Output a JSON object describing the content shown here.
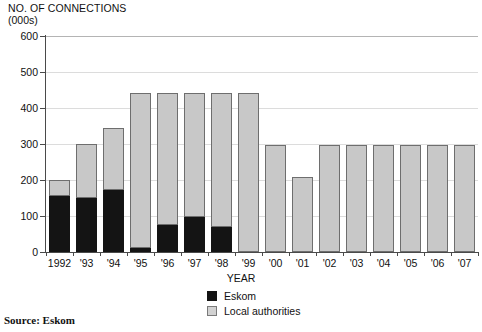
{
  "chart_data": {
    "type": "bar",
    "subtype": "stacked",
    "title": "NO. OF CONNECTIONS",
    "subtitle": "(000s)",
    "xlabel": "YEAR",
    "ylabel": "NO. OF CONNECTIONS (000s)",
    "ylim": [
      0,
      600
    ],
    "yticks": [
      0,
      100,
      200,
      300,
      400,
      500,
      600
    ],
    "ytick_labels": [
      "0",
      "100",
      "200",
      "300",
      "400",
      "500",
      "600"
    ],
    "grid": true,
    "legend_position": "bottom-center",
    "categories": [
      "1992",
      "'93",
      "'94",
      "'95",
      "'96",
      "'97",
      "'98",
      "'99",
      "'00",
      "'01",
      "'02",
      "'03",
      "'04",
      "'05",
      "'06",
      "'07"
    ],
    "series": [
      {
        "name": "Eskom",
        "color": "#141414",
        "values": [
          155,
          150,
          172,
          10,
          75,
          98,
          70,
          0,
          0,
          0,
          0,
          0,
          0,
          0,
          0,
          0
        ]
      },
      {
        "name": "Local authorities",
        "color": "#c8c8c8",
        "values": [
          45,
          150,
          173,
          433,
          368,
          345,
          373,
          443,
          298,
          207,
          296,
          296,
          296,
          296,
          296,
          296
        ]
      }
    ],
    "totals": [
      200,
      300,
      345,
      443,
      443,
      443,
      443,
      443,
      298,
      207,
      296,
      296,
      296,
      296,
      296,
      296
    ],
    "annotations": []
  },
  "legend": {
    "items": [
      {
        "label": "Eskom",
        "swatch": "legend-swatch-eskom"
      },
      {
        "label": "Local authorities",
        "swatch": "legend-swatch-local"
      }
    ]
  },
  "source": {
    "text": "Source: Eskom"
  },
  "colors": {
    "eskom": "#141414",
    "local_authorities": "#c8c8c8",
    "axis": "#4a4a4a",
    "grid": "#dcdcdc",
    "background": "#ffffff"
  }
}
